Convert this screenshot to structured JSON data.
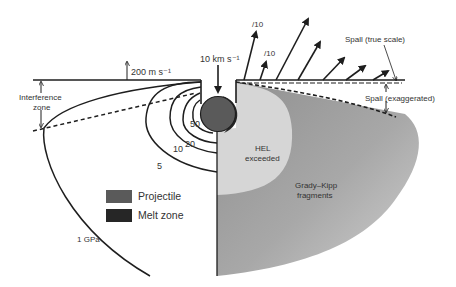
{
  "figure": {
    "left_half": {
      "impact_velocity": "10 km s⁻¹",
      "surface_velocity": "200 m s⁻¹",
      "interference_zone": [
        "Interference",
        "zone"
      ],
      "pressure_contours": [
        "50",
        "20",
        "10",
        "5"
      ],
      "outer_contour": "1 GPa"
    },
    "right_half": {
      "arrow_scale_labels": [
        "/10",
        "/10"
      ],
      "spall_true_scale": "Spall (true scale)",
      "spall_exaggerated": "Spall (exaggerated)",
      "hel_region": [
        "HEL",
        "exceeded"
      ],
      "grady_kipp_region": [
        "Grady–Kipp",
        "fragments"
      ]
    },
    "legend": [
      {
        "label": "Projectile",
        "color": "#5a5a5a"
      },
      {
        "label": "Melt zone",
        "color": "#262626"
      }
    ],
    "colors": {
      "line": "#1e1e1e",
      "hel_fill": "#d6d6d6",
      "grady_kipp_fill": "#a9a9a9",
      "projectile": "#5a5a5a",
      "melt": "#262626",
      "text": "#333333"
    }
  }
}
